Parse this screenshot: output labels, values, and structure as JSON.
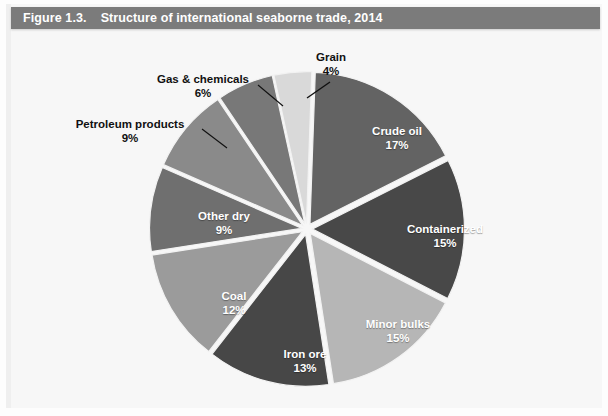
{
  "header": {
    "figure_number": "Figure 1.3.",
    "title": "Structure of international seaborne trade, 2014",
    "bar_color": "#7b7b7b",
    "text_color": "#ffffff"
  },
  "chart_data": {
    "type": "pie",
    "title": "Structure of international seaborne trade, 2014",
    "subtitle": "",
    "xlabel": "",
    "ylabel": "",
    "units": "percent",
    "legend_position": "none",
    "grid": false,
    "exploded": true,
    "start_angle_deg": -88,
    "categories": [
      "Crude oil",
      "Containerized",
      "Minor bulks",
      "Iron ore",
      "Coal",
      "Other dry",
      "Petroleum products",
      "Gas & chemicals",
      "Grain"
    ],
    "values": [
      17,
      15,
      15,
      13,
      12,
      9,
      9,
      6,
      4
    ],
    "value_labels": [
      "17%",
      "15%",
      "15%",
      "13%",
      "12%",
      "9%",
      "9%",
      "6%",
      "4%"
    ],
    "colors": [
      "#636363",
      "#484848",
      "#b6b6b6",
      "#474747",
      "#9b9b9b",
      "#6f6f6f",
      "#8a8a8a",
      "#787878",
      "#d9d9d9"
    ],
    "slices": [
      {
        "label": "Crude oil",
        "value": 17,
        "value_label": "17%",
        "color": "#636363",
        "label_placement": "inside",
        "label_color": "#ffffff"
      },
      {
        "label": "Containerized",
        "value": 15,
        "value_label": "15%",
        "color": "#484848",
        "label_placement": "inside",
        "label_color": "#ffffff"
      },
      {
        "label": "Minor bulks",
        "value": 15,
        "value_label": "15%",
        "color": "#b6b6b6",
        "label_placement": "inside",
        "label_color": "#ffffff"
      },
      {
        "label": "Iron ore",
        "value": 13,
        "value_label": "13%",
        "color": "#474747",
        "label_placement": "inside",
        "label_color": "#ffffff"
      },
      {
        "label": "Coal",
        "value": 12,
        "value_label": "12%",
        "color": "#9b9b9b",
        "label_placement": "inside",
        "label_color": "#ffffff"
      },
      {
        "label": "Other dry",
        "value": 9,
        "value_label": "9%",
        "color": "#6f6f6f",
        "label_placement": "inside",
        "label_color": "#ffffff"
      },
      {
        "label": "Petroleum products",
        "value": 9,
        "value_label": "9%",
        "color": "#8a8a8a",
        "label_placement": "outside",
        "label_color": "#111111"
      },
      {
        "label": "Gas & chemicals",
        "value": 6,
        "value_label": "6%",
        "color": "#787878",
        "label_placement": "outside",
        "label_color": "#111111"
      },
      {
        "label": "Grain",
        "value": 4,
        "value_label": "4%",
        "color": "#d9d9d9",
        "label_placement": "outside",
        "label_color": "#111111"
      }
    ]
  }
}
